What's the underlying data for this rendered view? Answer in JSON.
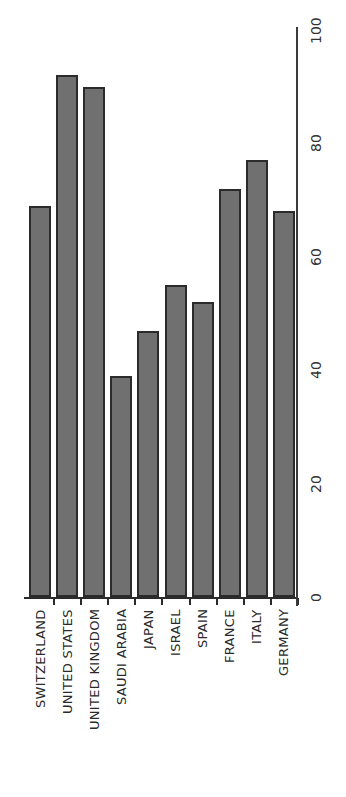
{
  "chart_data": {
    "type": "bar",
    "orientation": "vertical, rotated labels (axis on right)",
    "title": "",
    "xlabel": "",
    "ylabel": "",
    "categories": [
      "SWITZERLAND",
      "UNITED  STATES",
      "UNITED KINGDOM",
      "SAUDI  ARABIA",
      "JAPAN",
      "ISRAEL",
      "SPAIN",
      "FRANCE",
      "ITALY",
      "GERMANY"
    ],
    "values": [
      69,
      92,
      90,
      39,
      47,
      55,
      52,
      72,
      77,
      68
    ],
    "ylim": [
      0,
      100
    ],
    "yticks": [
      0,
      20,
      40,
      60,
      80,
      100
    ],
    "ytick_labels": [
      "0",
      "20",
      "40",
      "60",
      "80",
      "100"
    ],
    "grid": false,
    "legend": null,
    "colors": {
      "bar_fill": "#707070",
      "bar_edge": "#2b2b2b",
      "axis": "#2b2b2b",
      "text": "#2a2a2a"
    }
  }
}
